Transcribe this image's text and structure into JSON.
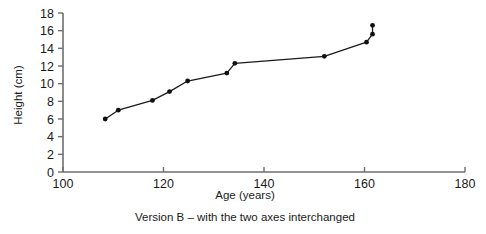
{
  "chart_data": {
    "type": "line",
    "title": "",
    "caption": "Version B – with the two axes interchanged",
    "xlabel": "Age (years)",
    "ylabel": "Height (cm)",
    "xlim": [
      100,
      180
    ],
    "ylim": [
      0,
      18
    ],
    "xticks": [
      100,
      120,
      140,
      160,
      180
    ],
    "yticks": [
      0,
      2,
      4,
      6,
      8,
      10,
      12,
      14,
      16,
      18
    ],
    "xtick_labels": [
      "100",
      "120",
      "140",
      "160",
      "180"
    ],
    "ytick_labels": [
      "0",
      "2",
      "4",
      "6",
      "8",
      "10",
      "12",
      "14",
      "16",
      "18"
    ],
    "grid": false,
    "legend": "none",
    "marker": "filled-circle",
    "line_color": "#1a1a1a",
    "marker_color": "#111111",
    "axis_color": "#6e6e6e",
    "series": [
      {
        "name": "height-vs-age",
        "points": [
          {
            "x": 108.4,
            "y": 6.0
          },
          {
            "x": 111.0,
            "y": 7.0
          },
          {
            "x": 117.8,
            "y": 8.1
          },
          {
            "x": 121.2,
            "y": 9.1
          },
          {
            "x": 124.8,
            "y": 10.3
          },
          {
            "x": 132.6,
            "y": 11.2
          },
          {
            "x": 134.2,
            "y": 12.3
          },
          {
            "x": 152.0,
            "y": 13.1
          },
          {
            "x": 160.4,
            "y": 14.7
          },
          {
            "x": 161.6,
            "y": 15.6
          },
          {
            "x": 161.6,
            "y": 16.6
          }
        ]
      }
    ]
  },
  "figure": {
    "caption_label": "Version B – with the two axes interchanged"
  }
}
